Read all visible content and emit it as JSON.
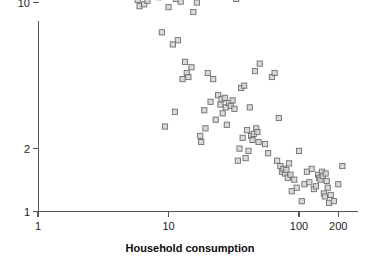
{
  "figure": {
    "width": 376,
    "height": 267,
    "background": "#ffffff",
    "marker_fill": "#d2d2d4",
    "marker_stroke": "#6e6e72",
    "axis_color": "#58585a"
  },
  "chart_data": {
    "type": "scatter",
    "title": "",
    "xlabel": "Household consumption",
    "ylabel": "",
    "xscale": "log",
    "yscale": "log",
    "xlim": [
      1,
      230
    ],
    "ylim": [
      1,
      55
    ],
    "grid": false,
    "legend": null,
    "xticks": [
      1,
      10,
      100,
      200
    ],
    "xtick_labels": [
      "1",
      "10",
      "100",
      "200"
    ],
    "yticks": [
      1,
      2,
      10,
      50
    ],
    "ytick_labels": [
      "1",
      "2",
      "10",
      "50"
    ],
    "marker": "square-open",
    "n_points": 152,
    "points": [
      [
        1.03,
        24.5
      ],
      [
        1.75,
        31.5
      ],
      [
        1.85,
        21.0
      ],
      [
        2.45,
        12.8
      ],
      [
        2.9,
        24.0
      ],
      [
        3.0,
        15.4
      ],
      [
        3.05,
        31.0
      ],
      [
        3.3,
        14.8
      ],
      [
        3.45,
        16.0
      ],
      [
        3.6,
        15.2
      ],
      [
        3.8,
        18.6
      ],
      [
        4.0,
        17.6
      ],
      [
        4.15,
        17.8
      ],
      [
        4.3,
        32.0
      ],
      [
        4.5,
        20.0
      ],
      [
        4.55,
        34.0
      ],
      [
        4.7,
        22.0
      ],
      [
        4.85,
        24.5
      ],
      [
        4.95,
        16.6
      ],
      [
        5.1,
        18.0
      ],
      [
        5.3,
        14.4
      ],
      [
        5.5,
        14.7
      ],
      [
        5.55,
        14.0
      ],
      [
        5.8,
        10.3
      ],
      [
        6.0,
        9.6
      ],
      [
        6.1,
        13.5
      ],
      [
        6.4,
        11.0
      ],
      [
        6.5,
        9.8
      ],
      [
        6.6,
        16.8
      ],
      [
        6.8,
        15.6
      ],
      [
        6.9,
        10.2
      ],
      [
        7.0,
        16.2
      ],
      [
        7.1,
        14.2
      ],
      [
        7.3,
        12.4
      ],
      [
        7.4,
        17.2
      ],
      [
        7.5,
        15.8
      ],
      [
        7.6,
        16.0
      ],
      [
        7.8,
        11.6
      ],
      [
        7.9,
        13.0
      ],
      [
        8.0,
        18.2
      ],
      [
        8.1,
        11.3
      ],
      [
        8.3,
        15.0
      ],
      [
        8.4,
        12.0
      ],
      [
        8.5,
        10.6
      ],
      [
        8.6,
        16.4
      ],
      [
        8.8,
        13.8
      ],
      [
        8.9,
        7.2
      ],
      [
        9.0,
        11.4
      ],
      [
        9.2,
        12.6
      ],
      [
        9.4,
        2.55
      ],
      [
        9.5,
        10.8
      ],
      [
        9.6,
        14.6
      ],
      [
        9.8,
        11.8
      ],
      [
        10.0,
        9.5
      ],
      [
        10.2,
        12.2
      ],
      [
        10.4,
        11.0
      ],
      [
        10.6,
        13.4
      ],
      [
        10.8,
        6.3
      ],
      [
        11.0,
        11.9
      ],
      [
        11.2,
        3.0
      ],
      [
        11.4,
        10.4
      ],
      [
        11.6,
        21.5
      ],
      [
        11.8,
        6.6
      ],
      [
        12.0,
        12.9
      ],
      [
        12.4,
        10.1
      ],
      [
        12.8,
        4.3
      ],
      [
        13.0,
        15.6
      ],
      [
        13.4,
        5.2
      ],
      [
        13.8,
        4.6
      ],
      [
        14.2,
        4.4
      ],
      [
        14.6,
        11.5
      ],
      [
        15.0,
        4.9
      ],
      [
        15.5,
        9.0
      ],
      [
        16.0,
        13.2
      ],
      [
        16.5,
        10.0
      ],
      [
        17.0,
        14.4
      ],
      [
        17.5,
        2.3
      ],
      [
        17.8,
        2.15
      ],
      [
        18.0,
        25.5
      ],
      [
        18.4,
        22.5
      ],
      [
        18.8,
        3.05
      ],
      [
        19.2,
        2.5
      ],
      [
        20.0,
        4.6
      ],
      [
        21.0,
        3.35
      ],
      [
        22.0,
        4.3
      ],
      [
        23.0,
        2.75
      ],
      [
        24.0,
        3.6
      ],
      [
        25.0,
        3.25
      ],
      [
        25.5,
        3.45
      ],
      [
        26.0,
        2.95
      ],
      [
        27.0,
        3.5
      ],
      [
        27.5,
        3.15
      ],
      [
        28.0,
        2.6
      ],
      [
        29.0,
        3.3
      ],
      [
        30.0,
        3.2
      ],
      [
        31.0,
        3.4
      ],
      [
        32.0,
        3.1
      ],
      [
        33.0,
        10.4
      ],
      [
        34.0,
        1.75
      ],
      [
        35.0,
        2.0
      ],
      [
        36.0,
        3.9
      ],
      [
        37.0,
        2.25
      ],
      [
        38.0,
        4.0
      ],
      [
        39.0,
        1.8
      ],
      [
        40.0,
        2.45
      ],
      [
        41.0,
        1.95
      ],
      [
        42.0,
        3.15
      ],
      [
        43.0,
        2.3
      ],
      [
        44.0,
        2.2
      ],
      [
        45.0,
        2.35
      ],
      [
        46.0,
        4.7
      ],
      [
        47.0,
        2.5
      ],
      [
        48.0,
        2.4
      ],
      [
        49.0,
        2.15
      ],
      [
        50.0,
        5.1
      ],
      [
        55.0,
        2.1
      ],
      [
        58.0,
        1.9
      ],
      [
        62.0,
        4.4
      ],
      [
        65.0,
        4.6
      ],
      [
        68.0,
        1.75
      ],
      [
        70.0,
        2.8
      ],
      [
        72.0,
        1.65
      ],
      [
        74.0,
        1.55
      ],
      [
        76.0,
        1.6
      ],
      [
        78.0,
        1.52
      ],
      [
        80.0,
        1.58
      ],
      [
        82.0,
        1.45
      ],
      [
        84.0,
        1.7
      ],
      [
        86.0,
        1.5
      ],
      [
        88.0,
        1.25
      ],
      [
        92.0,
        1.42
      ],
      [
        96.0,
        1.3
      ],
      [
        100.0,
        1.95
      ],
      [
        105.0,
        1.12
      ],
      [
        110.0,
        1.35
      ],
      [
        115.0,
        1.55
      ],
      [
        120.0,
        1.38
      ],
      [
        125.0,
        1.6
      ],
      [
        130.0,
        1.28
      ],
      [
        135.0,
        1.32
      ],
      [
        140.0,
        1.5
      ],
      [
        143.0,
        1.45
      ],
      [
        146.0,
        1.42
      ],
      [
        150.0,
        1.55
      ],
      [
        152.0,
        1.48
      ],
      [
        155.0,
        1.22
      ],
      [
        158.0,
        1.18
      ],
      [
        160.0,
        1.52
      ],
      [
        163.0,
        1.4
      ],
      [
        166.0,
        1.3
      ],
      [
        170.0,
        1.1
      ],
      [
        175.0,
        1.2
      ],
      [
        185.0,
        1.12
      ],
      [
        200.0,
        1.35
      ],
      [
        215.0,
        1.65
      ]
    ]
  }
}
